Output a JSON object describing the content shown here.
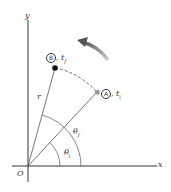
{
  "diagram": {
    "type": "polar-coordinates-rotation",
    "axes": {
      "x_label": "x",
      "y_label": "y",
      "origin_label": "O"
    },
    "points": {
      "A": {
        "marker": "A",
        "time": "t",
        "time_sub": "i",
        "color": "#999999"
      },
      "B": {
        "marker": "B",
        "time": "t",
        "time_sub": "f",
        "color": "#111111"
      }
    },
    "radius_label": "r",
    "angles": {
      "initial": {
        "symbol": "θ",
        "sub": "i"
      },
      "final": {
        "symbol": "θ",
        "sub": "f"
      }
    },
    "rotation_arrow": {
      "direction": "counterclockwise",
      "color": "#777777"
    },
    "colors": {
      "axis": "#333333",
      "line": "#555555",
      "dashed_path": "#444444",
      "arrow": "#777777"
    }
  }
}
